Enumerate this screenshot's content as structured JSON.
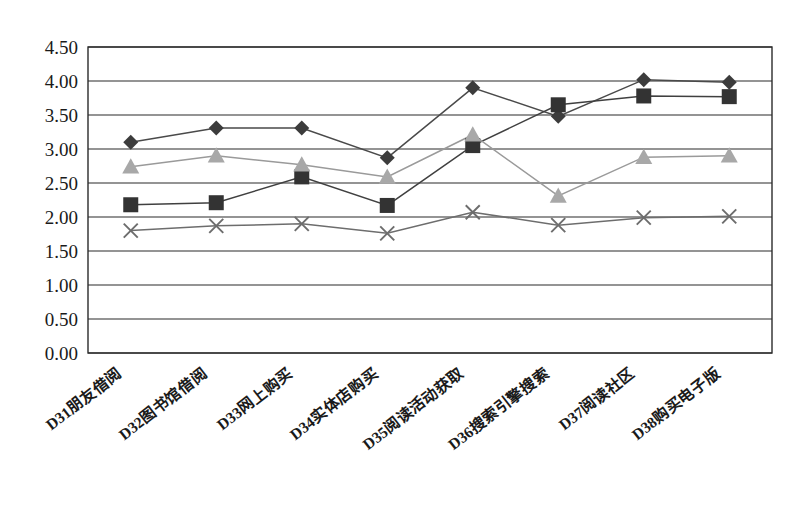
{
  "chart_data": {
    "type": "line",
    "title": "",
    "subtitle": "",
    "xlabel": "",
    "ylabel": "",
    "ylim": [
      0.0,
      4.5
    ],
    "ytick_step": 0.5,
    "grid": true,
    "legend_position": "none",
    "categories": [
      "D31朋友借阅",
      "D32图书馆借阅",
      "D33网上购买",
      "D34实体店购买",
      "D35阅读活动获取",
      "D36搜索引擎搜索",
      "D37阅读社区",
      "D38购买电子版"
    ],
    "ytick_labels": [
      "0.00",
      "0.50",
      "1.00",
      "1.50",
      "2.00",
      "2.50",
      "3.00",
      "3.50",
      "4.00",
      "4.50"
    ],
    "ytick_values": [
      0.0,
      0.5,
      1.0,
      1.5,
      2.0,
      2.5,
      3.0,
      3.5,
      4.0,
      4.5
    ],
    "series": [
      {
        "name": "series-1",
        "marker": "diamond",
        "color": "#3c3c3c",
        "line_color": "#4a4a4a",
        "values": [
          3.1,
          3.31,
          3.31,
          2.87,
          3.9,
          3.48,
          4.02,
          3.98
        ]
      },
      {
        "name": "series-2",
        "marker": "square",
        "color": "#333333",
        "line_color": "#404040",
        "values": [
          2.18,
          2.21,
          2.59,
          2.17,
          3.05,
          3.65,
          3.78,
          3.77
        ]
      },
      {
        "name": "series-3",
        "marker": "triangle",
        "color": "#a8a8a8",
        "line_color": "#9a9a9a",
        "values": [
          2.74,
          2.9,
          2.77,
          2.59,
          3.21,
          2.31,
          2.88,
          2.9
        ]
      },
      {
        "name": "series-4",
        "marker": "cross",
        "color": "#6d6d6d",
        "line_color": "#6d6d6d",
        "values": [
          1.8,
          1.87,
          1.9,
          1.76,
          2.07,
          1.88,
          1.99,
          2.01
        ]
      }
    ]
  },
  "caption": {
    "ghost_text": ""
  }
}
